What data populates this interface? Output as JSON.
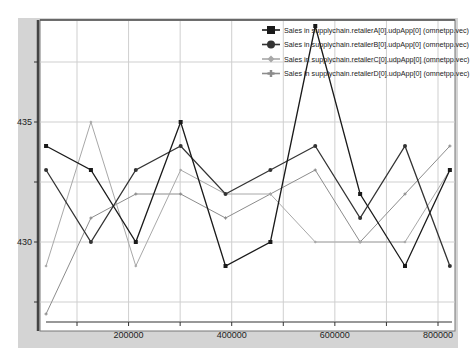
{
  "chart_data": {
    "type": "line",
    "title": "",
    "xlabel": "",
    "ylabel": "",
    "xlim": [
      25000,
      830000
    ],
    "ylim": [
      426.6,
      439.25
    ],
    "x_ticks": [
      200000,
      400000,
      600000,
      800000
    ],
    "x_tick_labels": [
      "200000",
      "400000",
      "600000",
      "800000"
    ],
    "x_minor_ticks": [
      100000,
      300000,
      500000,
      700000
    ],
    "y_ticks": [
      430,
      435
    ],
    "y_tick_labels": [
      "430",
      "435"
    ],
    "y_minor_ticks": [
      427.5,
      432.5,
      437.5
    ],
    "grid": true,
    "legend_position": "top-right",
    "x": [
      40000,
      127000,
      214000,
      301000,
      388000,
      475000,
      562000,
      649000,
      736000,
      823000
    ],
    "series": [
      {
        "name": "Sales in supplychain.retailerA[0].udpApp[0] (omnetpp.vec)",
        "marker": "square",
        "color": "#1a1a1a",
        "values": [
          434,
          433,
          430,
          435,
          429,
          430,
          439,
          432,
          429,
          433
        ]
      },
      {
        "name": "Sales in supplychain.retailerB[0].udpApp[0] (omnetpp.vec)",
        "marker": "circle",
        "color": "#333333",
        "values": [
          433,
          430,
          433,
          434,
          432,
          433,
          434,
          431,
          434,
          429
        ]
      },
      {
        "name": "Sales in supplychain.retailerC[0].udpApp[0] (omnetpp.vec)",
        "marker": "diamond",
        "color": "#a8a8a8",
        "values": [
          429,
          435,
          429,
          433,
          432,
          432,
          430,
          430,
          430,
          433
        ]
      },
      {
        "name": "Sales in supplychain.retailerD[0].udpApp[0] (omnetpp.vec)",
        "marker": "plus",
        "color": "#8c8c8c",
        "values": [
          427,
          431,
          432,
          432,
          431,
          432,
          433,
          430,
          432,
          434
        ]
      }
    ]
  }
}
